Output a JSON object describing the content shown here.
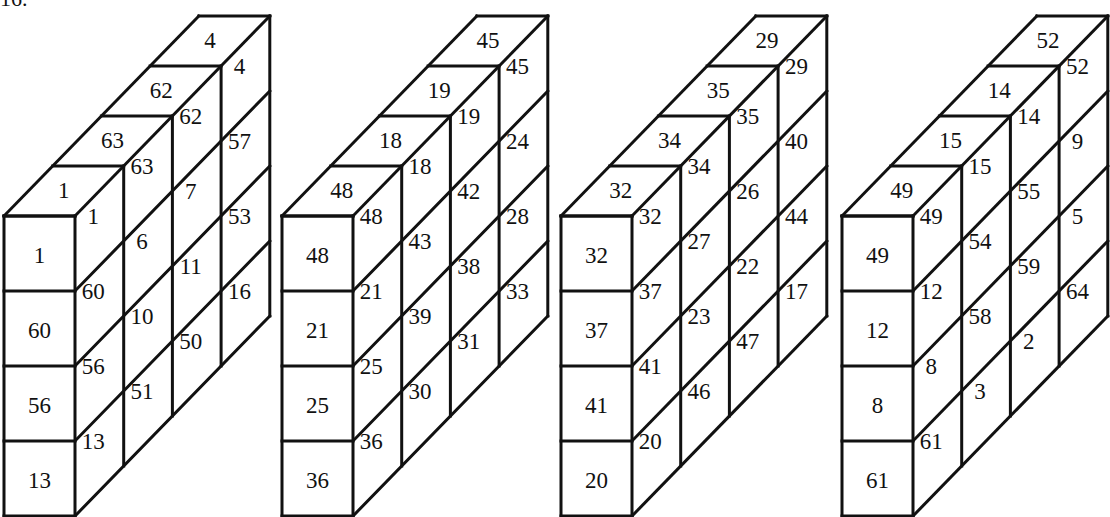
{
  "figure": {
    "label": "16.",
    "line_color": "#111111",
    "background": "#ffffff"
  },
  "slabs": [
    {
      "name": "slab-1",
      "front": [
        "1",
        "60",
        "56",
        "13"
      ],
      "top": [
        "1",
        "63",
        "62",
        "4"
      ],
      "side_columns": [
        [
          "1",
          "60",
          "56",
          "13"
        ],
        [
          "63",
          "6",
          "10",
          "51"
        ],
        [
          "62",
          "7",
          "11",
          "50"
        ],
        [
          "4",
          "57",
          "53",
          "16"
        ]
      ]
    },
    {
      "name": "slab-2",
      "front": [
        "48",
        "21",
        "25",
        "36"
      ],
      "top": [
        "48",
        "18",
        "19",
        "45"
      ],
      "side_columns": [
        [
          "48",
          "21",
          "25",
          "36"
        ],
        [
          "18",
          "43",
          "39",
          "30"
        ],
        [
          "19",
          "42",
          "38",
          "31"
        ],
        [
          "45",
          "24",
          "28",
          "33"
        ]
      ]
    },
    {
      "name": "slab-3",
      "front": [
        "32",
        "37",
        "41",
        "20"
      ],
      "top": [
        "32",
        "34",
        "35",
        "29"
      ],
      "side_columns": [
        [
          "32",
          "37",
          "41",
          "20"
        ],
        [
          "34",
          "27",
          "23",
          "46"
        ],
        [
          "35",
          "26",
          "22",
          "47"
        ],
        [
          "29",
          "40",
          "44",
          "17"
        ]
      ]
    },
    {
      "name": "slab-4",
      "front": [
        "49",
        "12",
        "8",
        "61"
      ],
      "top": [
        "49",
        "15",
        "14",
        "52"
      ],
      "side_columns": [
        [
          "49",
          "12",
          "8",
          "61"
        ],
        [
          "15",
          "54",
          "58",
          "3"
        ],
        [
          "14",
          "55",
          "59",
          "2"
        ],
        [
          "52",
          "9",
          "5",
          "64"
        ]
      ]
    }
  ]
}
